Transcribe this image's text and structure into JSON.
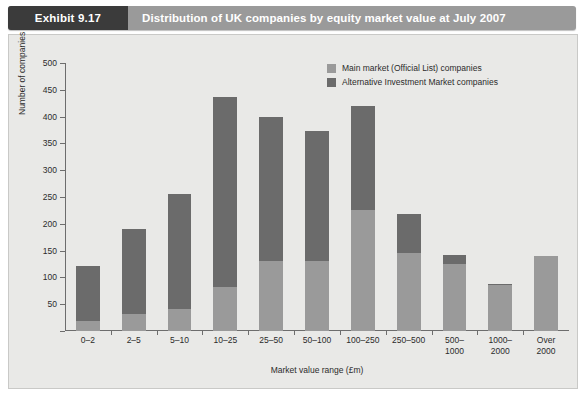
{
  "header": {
    "tag": "Exhibit 9.17",
    "title": "Distribution of UK companies by equity market value at July 2007",
    "tag_bg": "#3b3b3b",
    "bar_bg": "#9a9a9a"
  },
  "legend": {
    "items": [
      {
        "label": "Main market (Official List) companies",
        "color": "#9a9a9a"
      },
      {
        "label": "Alternative Investment Market companies",
        "color": "#6b6b6b"
      }
    ]
  },
  "chart_data": {
    "type": "bar",
    "title": "Distribution of UK companies by equity market value at July 2007",
    "xlabel": "Market value range (£m)",
    "ylabel": "Number of companies",
    "ylim": [
      0,
      500
    ],
    "yticks": [
      0,
      50,
      100,
      150,
      200,
      250,
      300,
      350,
      400,
      450,
      500
    ],
    "ytick_labels": [
      "0",
      "50",
      "100",
      "150",
      "200",
      "250",
      "300",
      "350",
      "400",
      "450",
      "500"
    ],
    "grid": false,
    "stacked": true,
    "legend_position": "top-right",
    "categories": [
      "0–2",
      "2–5",
      "5–10",
      "10–25",
      "25–50",
      "50–100",
      "100–250",
      "250–500",
      "500–\n1000",
      "1000–\n2000",
      "Over\n2000"
    ],
    "series": [
      {
        "name": "Main market (Official List) companies",
        "color": "#9a9a9a",
        "values": [
          18,
          32,
          42,
          82,
          130,
          130,
          225,
          145,
          125,
          85,
          140
        ]
      },
      {
        "name": "Alternative Investment Market companies",
        "color": "#6b6b6b",
        "values": [
          104,
          158,
          213,
          355,
          270,
          243,
          195,
          73,
          17,
          3,
          0
        ]
      }
    ],
    "totals": [
      122,
      190,
      255,
      437,
      400,
      373,
      420,
      218,
      142,
      88,
      140
    ]
  }
}
